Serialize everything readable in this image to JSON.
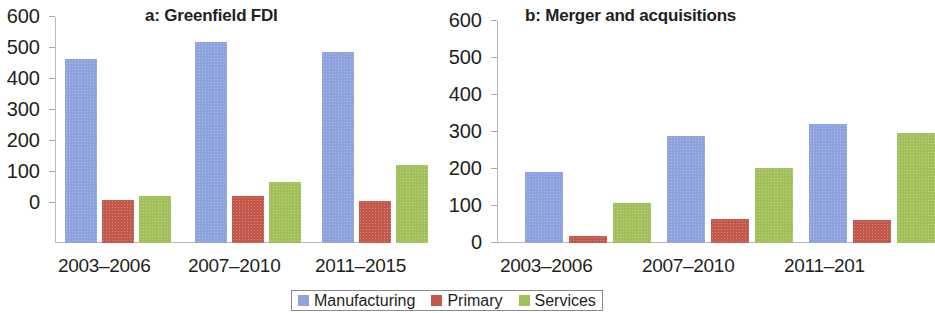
{
  "figure": {
    "background": "#ffffff",
    "legend_position": "bottom-center"
  },
  "legend": {
    "items": [
      {
        "label": "Manufacturing",
        "color": "#8ea3dd"
      },
      {
        "label": "Primary",
        "color": "#c4584a"
      },
      {
        "label": "Services",
        "color": "#a2c059"
      }
    ]
  },
  "panel_a": {
    "title": "a: Greenfield FDI",
    "categories": [
      "2003–2006",
      "2007–2010",
      "2011–2015"
    ],
    "y_ticks": [
      "600",
      "500",
      "400",
      "300",
      "200",
      "100",
      "0"
    ]
  },
  "panel_b": {
    "title": "b: Merger and acquisitions",
    "categories": [
      "2003–2006",
      "2007–2010",
      "2011–201"
    ],
    "y_ticks": [
      "600",
      "500",
      "400",
      "300",
      "200",
      "100",
      "0"
    ]
  },
  "chart_data": [
    {
      "type": "bar",
      "title": "a: Greenfield FDI",
      "xlabel": "",
      "ylabel": "",
      "ylim": [
        0,
        600
      ],
      "yticks": [
        0,
        100,
        200,
        300,
        400,
        500,
        600
      ],
      "grid": false,
      "legend": "bottom-center",
      "categories": [
        "2003–2006",
        "2007–2010",
        "2011–2015"
      ],
      "series": [
        {
          "name": "Manufacturing",
          "color": "#8ea3dd",
          "values": [
            463,
            519,
            486
          ]
        },
        {
          "name": "Primary",
          "color": "#c4584a",
          "values": [
            9,
            22,
            6
          ]
        },
        {
          "name": "Services",
          "color": "#a2c059",
          "values": [
            24,
            69,
            124
          ]
        }
      ]
    },
    {
      "type": "bar",
      "title": "b: Merger and acquisitions",
      "xlabel": "",
      "ylabel": "",
      "ylim": [
        0,
        600
      ],
      "yticks": [
        0,
        100,
        200,
        300,
        400,
        500,
        600
      ],
      "grid": false,
      "legend": "bottom-center",
      "categories": [
        "2003–2006",
        "2007–2010",
        "2011–2015"
      ],
      "series": [
        {
          "name": "Manufacturing",
          "color": "#8ea3dd",
          "values": [
            193,
            290,
            323
          ]
        },
        {
          "name": "Primary",
          "color": "#c4584a",
          "values": [
            19,
            65,
            62
          ]
        },
        {
          "name": "Services",
          "color": "#a2c059",
          "values": [
            109,
            203,
            298
          ]
        }
      ]
    }
  ]
}
